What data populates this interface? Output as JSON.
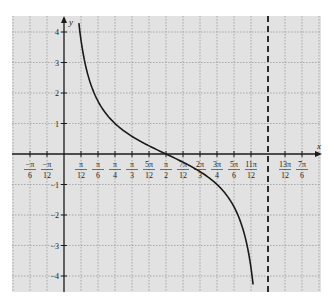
{
  "chart_data": {
    "type": "line",
    "title": "",
    "function": "y = cot(x)",
    "xlabel": "x",
    "ylabel": "y",
    "xlim_units_pi_over_12": [
      -3,
      14.5
    ],
    "ylim": [
      -4.5,
      4.5
    ],
    "grid": true,
    "grid_style": "dotted",
    "background": "#e2e2e2",
    "grid_color": "#9a9a9a",
    "curve_color": "#1a1a1a",
    "axis_color": "#1a1a1a",
    "x_ticks": [
      {
        "k": -2,
        "num": "−π",
        "den": "6"
      },
      {
        "k": -1,
        "num": "−π",
        "den": "12"
      },
      {
        "k": 1,
        "num": "π",
        "den": "12"
      },
      {
        "k": 2,
        "num": "π",
        "den": "6"
      },
      {
        "k": 3,
        "num": "π",
        "den": "4"
      },
      {
        "k": 4,
        "num": "π",
        "den": "3"
      },
      {
        "k": 5,
        "num": "5π",
        "den": "12"
      },
      {
        "k": 6,
        "num": "π",
        "den": "2"
      },
      {
        "k": 7,
        "num": "7π",
        "den": "12"
      },
      {
        "k": 8,
        "num": "2π",
        "den": "3"
      },
      {
        "k": 9,
        "num": "3π",
        "den": "4"
      },
      {
        "k": 10,
        "num": "5π",
        "den": "6"
      },
      {
        "k": 11,
        "num": "11π",
        "den": "12"
      },
      {
        "k": 13,
        "num": "13π",
        "den": "12"
      },
      {
        "k": 14,
        "num": "7π",
        "den": "6"
      }
    ],
    "y_ticks": [
      4,
      3,
      2,
      1,
      -1,
      -2,
      -3,
      -4
    ],
    "asymptotes": [
      {
        "k": 12,
        "label": "x = π",
        "style": "dashed"
      }
    ],
    "series": [
      {
        "name": "cot(x)",
        "x_range_rad": [
          0.229,
          2.912
        ],
        "points": [
          [
            0.229,
            4.3
          ],
          [
            0.262,
            3.73
          ],
          [
            0.3,
            3.23
          ],
          [
            0.35,
            2.74
          ],
          [
            0.4,
            2.37
          ],
          [
            0.45,
            2.07
          ],
          [
            0.524,
            1.73
          ],
          [
            0.6,
            1.46
          ],
          [
            0.7,
            1.19
          ],
          [
            0.785,
            1.0
          ],
          [
            0.9,
            0.79
          ],
          [
            1.047,
            0.58
          ],
          [
            1.2,
            0.39
          ],
          [
            1.309,
            0.27
          ],
          [
            1.4,
            0.17
          ],
          [
            1.571,
            0.0
          ],
          [
            1.7,
            -0.13
          ],
          [
            1.833,
            -0.27
          ],
          [
            1.95,
            -0.39
          ],
          [
            2.094,
            -0.58
          ],
          [
            2.25,
            -0.8
          ],
          [
            2.356,
            -1.0
          ],
          [
            2.5,
            -1.34
          ],
          [
            2.618,
            -1.73
          ],
          [
            2.7,
            -2.11
          ],
          [
            2.75,
            -2.43
          ],
          [
            2.8,
            -2.86
          ],
          [
            2.85,
            -3.45
          ],
          [
            2.88,
            -3.9
          ],
          [
            2.912,
            -4.3
          ]
        ]
      }
    ]
  }
}
